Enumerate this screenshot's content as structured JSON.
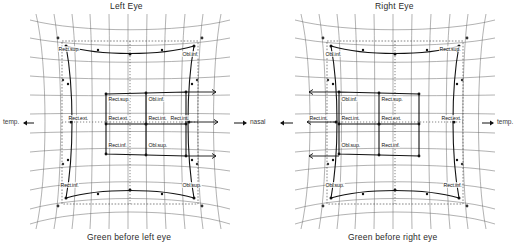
{
  "figure": {
    "kind": "hess-lancaster-screen-chart",
    "titles": {
      "left": "Left Eye",
      "right": "Right Eye"
    },
    "captions": {
      "left": "Green before left eye",
      "right": "Green before right eye"
    },
    "axis_labels": {
      "far_left": "temp.",
      "center": "nasal",
      "far_right": "temp."
    },
    "colors": {
      "grid": "#5a5a5a",
      "plot": "#111111",
      "dotted": "#333333",
      "text": "#1a1a1a",
      "background": "#ffffff"
    }
  },
  "left_panel": {
    "name": "Left Eye",
    "outer_labels": {
      "top_left": "Rect.sup.",
      "top_right": "Obl.inf.",
      "bottom_left": "Rect.inf.",
      "bottom_right": "Obl.sup.",
      "mid_left": "Rect.ext.",
      "mid_right": "Rect.int."
    },
    "inner_labels": {
      "top_left": "Rect.sup.",
      "top_right": "Obl.inf.",
      "mid_left": "Rect.ext.",
      "mid_right": "Rect.int.",
      "bottom_left": "Rect.inf.",
      "bottom_right": "Obl.sup."
    }
  },
  "right_panel": {
    "name": "Right Eye",
    "outer_labels": {
      "top_left": "Obl.inf.",
      "top_right": "Rect.sup.",
      "bottom_left": "Obl.sup.",
      "bottom_right": "Rect.inf.",
      "mid_left": "Rect.int.",
      "mid_right": "Rect.ext."
    },
    "inner_labels": {
      "top_left": "Obl.inf.",
      "top_right": "Rect.sup.",
      "mid_left": "Rect.int.",
      "mid_right": "Rect.ext.",
      "bottom_left": "Obl.sup.",
      "bottom_right": "Rect.inf."
    }
  }
}
